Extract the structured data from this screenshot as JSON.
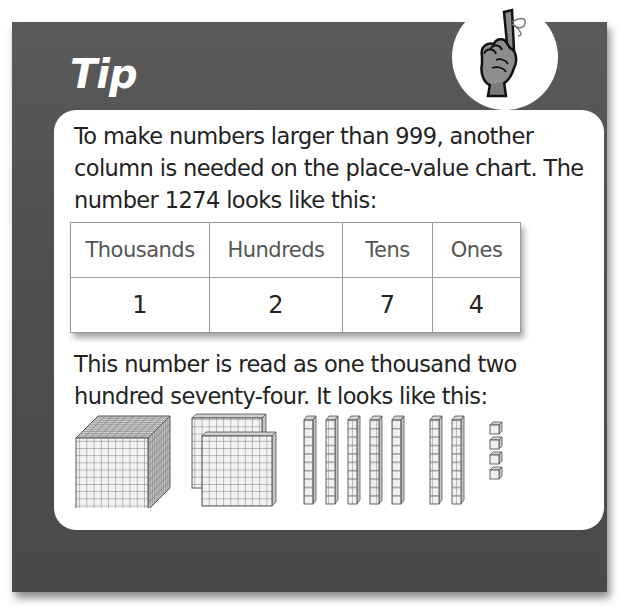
{
  "tip": {
    "title": "Tip",
    "icon": "hand-finger-string-icon"
  },
  "content": {
    "paragraph1": "To make numbers larger than 999, another column is needed on the place-value chart. The number 1274 looks like this:",
    "paragraph2": "This number is read as one thousand two hundred seventy-four. It looks like this:"
  },
  "place_value_table": {
    "headers": [
      "Thousands",
      "Hundreds",
      "Tens",
      "Ones"
    ],
    "values": [
      "1",
      "2",
      "7",
      "4"
    ]
  },
  "base_ten_blocks": {
    "thousands_cubes": 1,
    "hundreds_flats": 2,
    "tens_rods": 7,
    "ones_units": 4,
    "icons": [
      "thousand-cube-icon",
      "hundred-flat-icon",
      "ten-rod-icon",
      "unit-cube-icon"
    ]
  },
  "colors": {
    "card_background": "#505050",
    "panel_background": "#ffffff",
    "title_text": "#ffffff",
    "body_text": "#222222",
    "table_header_text": "#555555",
    "table_border": "#9a9a9a"
  }
}
